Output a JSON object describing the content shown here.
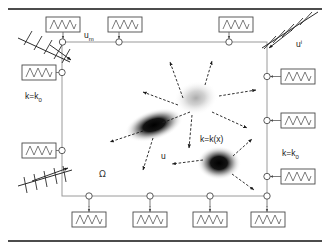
{
  "figure": {
    "background_color": "#ffffff",
    "width": 330,
    "height": 250
  },
  "labels": {
    "measured_boundary": {
      "base": "u",
      "sub": "m",
      "sup": ""
    },
    "incident_boundary": {
      "base": "u",
      "sub": "",
      "sup": "i"
    },
    "conductivity_left": {
      "base": "k=k",
      "sub": "0",
      "sup": ""
    },
    "conductivity_right": {
      "base": "k=k",
      "sub": "0",
      "sup": ""
    },
    "conductivity_interior": {
      "base": "k=k(x)",
      "sub": "",
      "sup": ""
    },
    "domain_symbol": {
      "base": "Ω",
      "sub": "",
      "sup": ""
    },
    "field_variable": {
      "base": "u",
      "sub": "",
      "sup": ""
    }
  },
  "colors": {
    "stroke_dark": "#111111",
    "stroke_mid": "#5a5a5a",
    "domain_edge": "#9a9a9a",
    "blob_dark": "#000000",
    "blob_light": "#c8c8c8",
    "background": "#ffffff"
  },
  "domain_box": {
    "x": 62,
    "y": 42,
    "width": 205,
    "height": 154
  },
  "rules": [
    {
      "name": "top-rule",
      "y": 9
    },
    {
      "name": "bottom-rule",
      "y": 241
    }
  ],
  "springs": {
    "top": [
      {
        "box_x": 46,
        "box_y": 17,
        "node_x": 62,
        "node_y": 42
      },
      {
        "box_x": 108,
        "box_y": 17,
        "node_x": 119,
        "node_y": 42
      },
      {
        "box_x": 219,
        "box_y": 17,
        "node_x": 229,
        "node_y": 42
      }
    ],
    "left": [
      {
        "box_x": 22,
        "box_y": 62,
        "node_x": 62,
        "node_y": 72
      },
      {
        "box_x": 22,
        "box_y": 141,
        "node_x": 62,
        "node_y": 150
      }
    ],
    "right": [
      {
        "box_x": 281,
        "box_y": 66,
        "node_x": 267,
        "node_y": 76
      },
      {
        "box_x": 281,
        "box_y": 111,
        "node_x": 267,
        "node_y": 120
      },
      {
        "box_x": 281,
        "box_y": 166,
        "node_x": 267,
        "node_y": 176
      }
    ],
    "bottom": [
      {
        "box_x": 74,
        "box_y": 213,
        "node_x": 89,
        "node_y": 196
      },
      {
        "box_x": 134,
        "box_y": 213,
        "node_x": 150,
        "node_y": 196
      },
      {
        "box_x": 194,
        "box_y": 213,
        "node_x": 209,
        "node_y": 196
      },
      {
        "box_x": 252,
        "box_y": 213,
        "node_x": 267,
        "node_y": 196
      }
    ]
  },
  "hatched_supports": [
    {
      "name": "top-left-support",
      "x1": 18,
      "y1": 38,
      "x2": 70,
      "y2": 62,
      "ticks": 5
    },
    {
      "name": "top-right-support",
      "x1": 318,
      "y1": 12,
      "x2": 262,
      "y2": 48,
      "ticks": 5
    },
    {
      "name": "bottom-left-support",
      "x1": 18,
      "y1": 186,
      "x2": 72,
      "y2": 170,
      "ticks": 6
    }
  ],
  "blobs": [
    {
      "name": "light-blob",
      "cx": 196,
      "cy": 98,
      "rx": 19,
      "ry": 14,
      "rotate": -12,
      "intensity": "light",
      "color": "#b5b5b5"
    },
    {
      "name": "dark-elongated-blob",
      "cx": 154,
      "cy": 125,
      "rx": 26,
      "ry": 12,
      "rotate": -18,
      "intensity": "dark",
      "color": "#050505"
    },
    {
      "name": "dark-round-blob",
      "cx": 219,
      "cy": 163,
      "rx": 19,
      "ry": 14,
      "rotate": 0,
      "intensity": "dark",
      "color": "#000000"
    }
  ],
  "flux_arrows": [
    {
      "name": "flux-arrow-up-left",
      "x1": 183,
      "y1": 98,
      "x2": 170,
      "y2": 62
    },
    {
      "name": "flux-arrow-up-right",
      "x1": 205,
      "y1": 85,
      "x2": 212,
      "y2": 61
    },
    {
      "name": "flux-arrow-right-a",
      "x1": 219,
      "y1": 96,
      "x2": 256,
      "y2": 90
    },
    {
      "name": "flux-arrow-right-b",
      "x1": 212,
      "y1": 112,
      "x2": 247,
      "y2": 128
    },
    {
      "name": "flux-arrow-left-a",
      "x1": 178,
      "y1": 105,
      "x2": 143,
      "y2": 92
    },
    {
      "name": "flux-arrow-center",
      "x1": 190,
      "y1": 112,
      "x2": 162,
      "y2": 123
    },
    {
      "name": "flux-arrow-left-b",
      "x1": 143,
      "y1": 131,
      "x2": 110,
      "y2": 142
    },
    {
      "name": "flux-arrow-down-a",
      "x1": 153,
      "y1": 138,
      "x2": 143,
      "y2": 170
    },
    {
      "name": "flux-arrow-down-b",
      "x1": 192,
      "y1": 115,
      "x2": 189,
      "y2": 148
    },
    {
      "name": "flux-arrow-to-round",
      "x1": 203,
      "y1": 160,
      "x2": 172,
      "y2": 164
    },
    {
      "name": "flux-arrow-round-up",
      "x1": 233,
      "y1": 156,
      "x2": 252,
      "y2": 139
    },
    {
      "name": "flux-arrow-round-down",
      "x1": 232,
      "y1": 174,
      "x2": 254,
      "y2": 190
    }
  ],
  "support_arrows": [
    {
      "name": "support-arrow-top-left",
      "x1": 52,
      "y1": 47,
      "x2": 71,
      "y2": 60
    },
    {
      "name": "support-arrow-top-right",
      "x1": 292,
      "y1": 30,
      "x2": 269,
      "y2": 48
    },
    {
      "name": "support-arrow-bottom-left",
      "x1": 32,
      "y1": 181,
      "x2": 68,
      "y2": 168
    }
  ],
  "label_positions": {
    "measured_boundary": {
      "x": 84,
      "y": 38
    },
    "incident_boundary": {
      "x": 296,
      "y": 47
    },
    "conductivity_left": {
      "x": 27,
      "y": 98
    },
    "conductivity_right": {
      "x": 284,
      "y": 156
    },
    "conductivity_interior": {
      "x": 200,
      "y": 142
    },
    "domain_symbol": {
      "x": 99,
      "y": 176
    },
    "field_variable": {
      "x": 162,
      "y": 158
    }
  }
}
